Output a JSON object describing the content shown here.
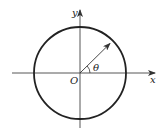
{
  "diagram": {
    "type": "unit-circle",
    "labels": {
      "x_axis": "x",
      "y_axis": "y",
      "origin": "O",
      "angle": "θ"
    },
    "geometry": {
      "origin": [
        80,
        73
      ],
      "radius": 46,
      "angle_deg": 40
    },
    "colors": {
      "stroke": "#222222",
      "axis": "#444444",
      "background": "#ffffff"
    }
  }
}
